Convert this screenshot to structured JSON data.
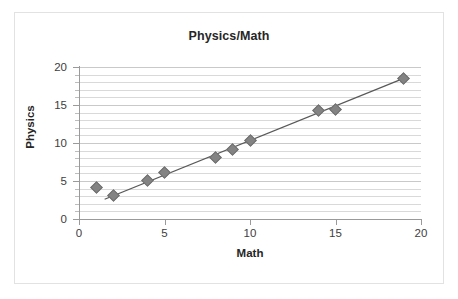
{
  "chart_data": {
    "type": "scatter",
    "title": "Physics/Math",
    "xlabel": "Math",
    "ylabel": "Physics",
    "xlim": [
      0,
      20
    ],
    "ylim": [
      0,
      20
    ],
    "x_ticks": [
      "0",
      "5",
      "10",
      "15",
      "20"
    ],
    "y_ticks": [
      "0",
      "5",
      "10",
      "15",
      "20"
    ],
    "x_tick_values": [
      0,
      5,
      10,
      15,
      20
    ],
    "y_tick_values": [
      0,
      5,
      10,
      15,
      20
    ],
    "grid": "horizontal-minor-every-1-unit",
    "legend": "none",
    "marker_shape": "diamond",
    "marker_color": "#838383",
    "trendline_color": "#595959",
    "x": [
      1,
      2,
      4,
      5,
      8,
      9,
      10,
      14,
      15,
      19
    ],
    "y": [
      4.2,
      3.1,
      5.1,
      6.1,
      8.1,
      9.2,
      10.3,
      14.3,
      14.4,
      18.5
    ],
    "points": [
      {
        "x": 1,
        "y": 4.2
      },
      {
        "x": 2,
        "y": 3.1
      },
      {
        "x": 4,
        "y": 5.1
      },
      {
        "x": 5,
        "y": 6.1
      },
      {
        "x": 8,
        "y": 8.1
      },
      {
        "x": 9,
        "y": 9.2
      },
      {
        "x": 10,
        "y": 10.3
      },
      {
        "x": 14,
        "y": 14.3
      },
      {
        "x": 15,
        "y": 14.4
      },
      {
        "x": 19,
        "y": 18.5
      }
    ],
    "trendline": {
      "x1": 1.5,
      "y1": 2.6,
      "x2": 19.2,
      "y2": 18.7
    }
  }
}
